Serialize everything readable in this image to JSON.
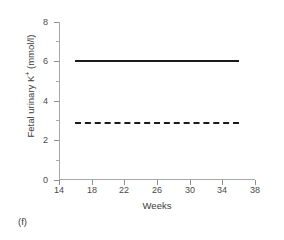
{
  "panel": {
    "label": "(f)"
  },
  "chart_data": {
    "type": "line",
    "title": "",
    "xlabel": "Weeks",
    "ylabel": "Fetal urinary K+ (mmol/l)",
    "ylabel_base": "Fetal urinary K",
    "ylabel_sup": "+",
    "ylabel_unit": " (mmol/l)",
    "xlim": [
      14,
      38
    ],
    "ylim": [
      0,
      8
    ],
    "xticks": [
      14,
      18,
      22,
      26,
      30,
      34,
      38
    ],
    "yticks": [
      0,
      2,
      4,
      6,
      8
    ],
    "yminorticks": [
      1,
      3,
      5,
      7
    ],
    "grid": false,
    "legend": "none",
    "x": [
      16,
      36
    ],
    "series": [
      {
        "name": "upper reference limit",
        "style": "solid",
        "color": "#1a1a1a",
        "values": [
          6.1,
          6.1
        ]
      },
      {
        "name": "lower reference limit",
        "style": "dashed",
        "color": "#1a1a1a",
        "values": [
          2.95,
          2.95
        ]
      }
    ]
  },
  "yticklabels": [
    "0",
    "2",
    "4",
    "6",
    "8"
  ],
  "xticklabels": [
    "14",
    "18",
    "22",
    "26",
    "30",
    "34",
    "38"
  ]
}
